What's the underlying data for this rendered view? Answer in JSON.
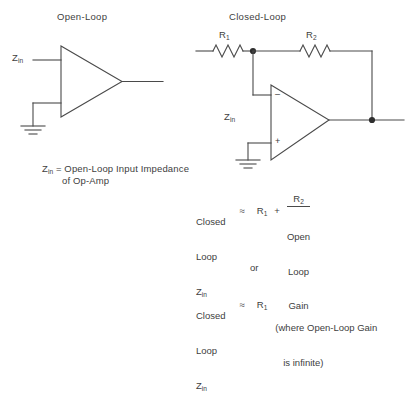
{
  "document": {
    "kind": "op-amp input impedance diagram",
    "background_color": "#ffffff",
    "ink_color": "#4a4a4a",
    "text_color": "#404040"
  },
  "open_loop": {
    "title": "Open-Loop",
    "input_label_base": "Z",
    "input_label_sub": "in",
    "ground_label": "ground",
    "caption": {
      "base": "Z",
      "sub": "in",
      "line1": " = Open-Loop Input Impedance",
      "line2": "of Op-Amp"
    }
  },
  "closed_loop": {
    "title": "Closed-Loop",
    "resistor_1": {
      "base": "R",
      "sub": "1"
    },
    "resistor_2": {
      "base": "R",
      "sub": "2"
    },
    "input_label_base": "Z",
    "input_label_sub": "in",
    "inverting_sign": "–",
    "noninverting_sign": "+"
  },
  "equations": {
    "eq1": {
      "lhs_line1": "Closed",
      "lhs_line2": "Loop",
      "lhs_line3_base": "Z",
      "lhs_line3_sub": "in",
      "approx": "≈",
      "term1_base": "R",
      "term1_sub": "1",
      "operator": "+",
      "numerator_base": "R",
      "numerator_sub": "2",
      "denominator_line1": "Open",
      "denominator_line2": "Loop",
      "denominator_line3": "Gain"
    },
    "connector": "or",
    "eq2": {
      "lhs_line1": "Closed",
      "lhs_line2": "Loop",
      "lhs_line3_base": "Z",
      "lhs_line3_sub": "in",
      "approx": "≈",
      "term1_base": "R",
      "term1_sub": "1",
      "note_line1": "(where Open-Loop Gain",
      "note_line2": "   is infinite)"
    }
  }
}
